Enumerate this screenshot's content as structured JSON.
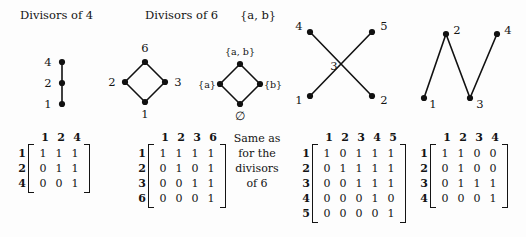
{
  "figure": {
    "background_color": "#fdfdfd",
    "ink_color": "#141414"
  },
  "headers": [
    {
      "id": "divisors-of-4",
      "label": "Divisors of 4"
    },
    {
      "id": "divisors-of-6",
      "label": "Divisors of 6"
    },
    {
      "id": "set-ab",
      "label": "{a, b}"
    }
  ],
  "graphs": [
    {
      "id": "divisors-of-4-graph",
      "shape": "vertical-chain",
      "vertices": [
        {
          "label": "4",
          "x": 62,
          "y": 62,
          "label_side": "left"
        },
        {
          "label": "2",
          "x": 62,
          "y": 83,
          "label_side": "left"
        },
        {
          "label": "1",
          "x": 62,
          "y": 104,
          "label_side": "left"
        }
      ],
      "edges": [
        [
          0,
          1
        ],
        [
          1,
          2
        ]
      ]
    },
    {
      "id": "divisors-of-6-graph",
      "shape": "diamond",
      "vertices": [
        {
          "label": "6",
          "x": 145,
          "y": 62,
          "label_side": "above"
        },
        {
          "label": "2",
          "x": 125,
          "y": 82,
          "label_side": "left"
        },
        {
          "label": "3",
          "x": 165,
          "y": 82,
          "label_side": "right"
        },
        {
          "label": "1",
          "x": 145,
          "y": 102,
          "label_side": "below"
        }
      ],
      "edges": [
        [
          0,
          1
        ],
        [
          0,
          2
        ],
        [
          1,
          3
        ],
        [
          2,
          3
        ]
      ]
    },
    {
      "id": "powerset-ab-graph",
      "shape": "diamond",
      "vertices": [
        {
          "label": "{a, b}",
          "x": 240,
          "y": 64,
          "label_side": "above"
        },
        {
          "label": "{a}",
          "x": 220,
          "y": 84,
          "label_side": "left"
        },
        {
          "label": "{b}",
          "x": 260,
          "y": 84,
          "label_side": "right"
        },
        {
          "label": "∅",
          "x": 240,
          "y": 104,
          "label_side": "below"
        }
      ],
      "edges": [
        [
          0,
          1
        ],
        [
          0,
          2
        ],
        [
          1,
          3
        ],
        [
          2,
          3
        ]
      ]
    },
    {
      "id": "crossing-graph",
      "shape": "crossing-x",
      "center_label": "3",
      "center_label_x": 334,
      "center_label_y": 66,
      "vertices": [
        {
          "label": "4",
          "x": 310,
          "y": 32,
          "label_side": "left"
        },
        {
          "label": "5",
          "x": 372,
          "y": 32,
          "label_side": "right"
        },
        {
          "label": "1",
          "x": 310,
          "y": 96,
          "label_side": "left"
        },
        {
          "label": "2",
          "x": 372,
          "y": 96,
          "label_side": "right"
        }
      ],
      "edges": [
        [
          0,
          3
        ],
        [
          2,
          1
        ]
      ]
    },
    {
      "id": "zigzag-graph",
      "shape": "zigzag-path",
      "vertices": [
        {
          "label": "1",
          "x": 424,
          "y": 98,
          "label_side": "right-below"
        },
        {
          "label": "2",
          "x": 446,
          "y": 34,
          "label_side": "right-above"
        },
        {
          "label": "3",
          "x": 470,
          "y": 98,
          "label_side": "right-below"
        },
        {
          "label": "4",
          "x": 497,
          "y": 34,
          "label_side": "right-above"
        }
      ],
      "edges": [
        [
          0,
          1
        ],
        [
          1,
          2
        ],
        [
          2,
          3
        ]
      ]
    }
  ],
  "matrices": [
    {
      "id": "matrix-divisors-of-4",
      "col_headers": [
        "1",
        "2",
        "4"
      ],
      "row_headers": [
        "1",
        "2",
        "4"
      ],
      "rows": [
        [
          "1",
          "1",
          "1"
        ],
        [
          "0",
          "1",
          "1"
        ],
        [
          "0",
          "0",
          "1"
        ]
      ]
    },
    {
      "id": "matrix-divisors-of-6",
      "col_headers": [
        "1",
        "2",
        "3",
        "6"
      ],
      "row_headers": [
        "1",
        "2",
        "3",
        "6"
      ],
      "rows": [
        [
          "1",
          "1",
          "1",
          "1"
        ],
        [
          "0",
          "1",
          "0",
          "1"
        ],
        [
          "0",
          "0",
          "1",
          "1"
        ],
        [
          "0",
          "0",
          "0",
          "1"
        ]
      ]
    },
    {
      "id": "matrix-crossing-graph",
      "col_headers": [
        "1",
        "2",
        "3",
        "4",
        "5"
      ],
      "row_headers": [
        "1",
        "2",
        "3",
        "4",
        "5"
      ],
      "rows": [
        [
          "1",
          "0",
          "1",
          "1",
          "1"
        ],
        [
          "0",
          "1",
          "1",
          "1",
          "1"
        ],
        [
          "0",
          "0",
          "1",
          "1",
          "1"
        ],
        [
          "0",
          "0",
          "0",
          "1",
          "0"
        ],
        [
          "0",
          "0",
          "0",
          "0",
          "1"
        ]
      ]
    },
    {
      "id": "matrix-zigzag-graph",
      "col_headers": [
        "1",
        "2",
        "3",
        "4"
      ],
      "row_headers": [
        "1",
        "2",
        "3",
        "4"
      ],
      "rows": [
        [
          "1",
          "1",
          "0",
          "0"
        ],
        [
          "0",
          "1",
          "0",
          "0"
        ],
        [
          "0",
          "1",
          "1",
          "1"
        ],
        [
          "0",
          "0",
          "0",
          "1"
        ]
      ]
    }
  ],
  "note": {
    "id": "same-as-divisors-of-6-note",
    "lines": [
      "Same as",
      "for the",
      "divisors",
      "of 6"
    ]
  }
}
